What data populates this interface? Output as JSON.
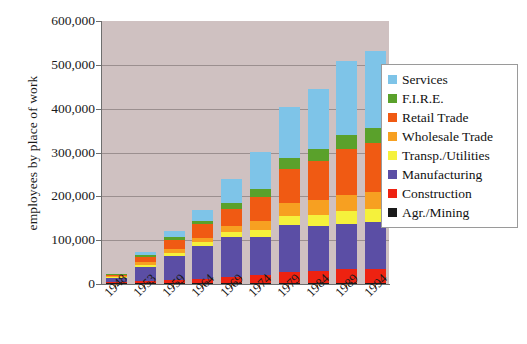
{
  "chart_data": {
    "type": "bar",
    "stacked": true,
    "title": "",
    "xlabel": "",
    "ylabel": "employees by place of work",
    "ylim": [
      0,
      600000
    ],
    "ytick_labels": [
      "0",
      "100,000",
      "200,000",
      "300,000",
      "400,000",
      "500,000",
      "600,000"
    ],
    "ytick_values": [
      0,
      100000,
      200000,
      300000,
      400000,
      500000,
      600000
    ],
    "grid": true,
    "legend_position": "right",
    "plot_background": "#cfc1c1",
    "categories": [
      "1948",
      "1953",
      "1959",
      "1964",
      "1969",
      "1974",
      "1979",
      "1984",
      "1989",
      "1994"
    ],
    "series": [
      {
        "name": "Agr./Mining",
        "color": "#1a1a1a",
        "values": [
          1500,
          2000,
          2000,
          2000,
          2000,
          2500,
          3000,
          3000,
          3000,
          3000
        ]
      },
      {
        "name": "Construction",
        "color": "#ee2211",
        "values": [
          3000,
          5500,
          8000,
          10000,
          14000,
          19000,
          25000,
          26000,
          31000,
          31000
        ]
      },
      {
        "name": "Manufacturing",
        "color": "#5b4ea5",
        "values": [
          9000,
          32000,
          53000,
          74000,
          92000,
          85000,
          107000,
          104000,
          104000,
          108000
        ]
      },
      {
        "name": "Transp./Utilities",
        "color": "#f5f13c",
        "values": [
          2000,
          5000,
          7000,
          9000,
          11000,
          16000,
          21000,
          24000,
          28000,
          29000
        ]
      },
      {
        "name": "Wholesale Trade",
        "color": "#f7a021",
        "values": [
          2000,
          6000,
          9000,
          11000,
          13000,
          21000,
          30000,
          34000,
          38000,
          40000
        ]
      },
      {
        "name": "Retail Trade",
        "color": "#f05a13",
        "values": [
          3500,
          12000,
          21000,
          30000,
          40000,
          56000,
          77000,
          89000,
          103000,
          110000
        ]
      },
      {
        "name": "F.I.R.E.",
        "color": "#5aa12b",
        "values": [
          1000,
          4000,
          7000,
          9000,
          12000,
          17000,
          25000,
          29000,
          34000,
          35000
        ]
      },
      {
        "name": "Services",
        "color": "#7ec4e8",
        "values": [
          2000,
          7000,
          15000,
          25000,
          56000,
          84000,
          116000,
          137000,
          167000,
          175000
        ]
      }
    ],
    "totals": [
      24000,
      73500,
      122000,
      170000,
      240000,
      300500,
      404000,
      446000,
      508000,
      531000
    ]
  },
  "legend": {
    "items": [
      {
        "label": "Services",
        "color": "#7ec4e8"
      },
      {
        "label": "F.I.R.E.",
        "color": "#5aa12b"
      },
      {
        "label": "Retail Trade",
        "color": "#f05a13"
      },
      {
        "label": "Wholesale Trade",
        "color": "#f7a021"
      },
      {
        "label": "Transp./Utilities",
        "color": "#f5f13c"
      },
      {
        "label": "Manufacturing",
        "color": "#5b4ea5"
      },
      {
        "label": "Construction",
        "color": "#ee2211"
      },
      {
        "label": "Agr./Mining",
        "color": "#1a1a1a"
      }
    ]
  }
}
